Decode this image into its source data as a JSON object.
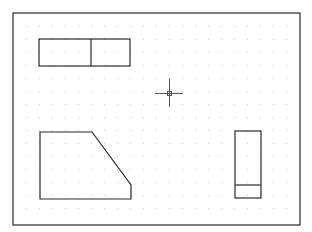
{
  "drawing": {
    "background": "#ffffff",
    "line_color": "#2a2a2a",
    "grid_dot_color": "#c4c4c4",
    "frame": {
      "x": 13,
      "y": 13,
      "width": 287,
      "height": 212
    },
    "grid": {
      "start_x": 26,
      "start_y": 26,
      "spacing": 13,
      "end_x": 295,
      "end_y": 220
    },
    "crosshair": {
      "x": 169,
      "y": 93,
      "arm": 14,
      "box": 2
    },
    "shapes": {
      "top_view_rect": {
        "x": 39,
        "y": 39,
        "width": 91,
        "height": 27,
        "divider_x": 91
      },
      "front_view_polygon": "40,132 92,132 131,185 131,199 40,199",
      "side_view_rect": {
        "x": 235,
        "y": 131,
        "width": 26,
        "height": 67,
        "divider_y": 185
      }
    }
  }
}
